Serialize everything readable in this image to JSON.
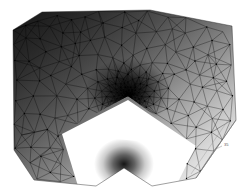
{
  "figure": {
    "kind": "finite-element-mesh",
    "background_color": "#ffffff",
    "ink_color": "#000000",
    "corner_label": "35",
    "canvas": {
      "width": 243,
      "height": 188
    }
  },
  "chart_data": {
    "type": "scatter",
    "subtitle": "Grayscale shaded solution field over a doubly notched polygonal domain",
    "xlabel": "",
    "ylabel": "",
    "xlim": [
      0,
      243
    ],
    "ylim": [
      0,
      188
    ],
    "grid": false,
    "legend_position": "none",
    "annotations": [
      "35"
    ],
    "domain_outline": [
      [
        13,
        30
      ],
      [
        42,
        12
      ],
      [
        150,
        10
      ],
      [
        232,
        26
      ],
      [
        236,
        120
      ],
      [
        196,
        178
      ],
      [
        34,
        180
      ],
      [
        14,
        150
      ]
    ],
    "notches": [
      {
        "name": "upper-notch",
        "tip": [
          128,
          96
        ],
        "opening_left": [
          60,
          132
        ],
        "opening_right": [
          190,
          140
        ],
        "refinement_levels": 9,
        "min_element_size_px": 0.4
      },
      {
        "name": "lower-notch",
        "tip": [
          124,
          168
        ],
        "opening_left": [
          96,
          186
        ],
        "opening_right": [
          152,
          186
        ],
        "refinement_levels": 8,
        "min_element_size_px": 0.4
      }
    ],
    "shading": {
      "colormap": "grayscale",
      "dark_value_corner": "upper-left",
      "light_value_corner": "lower-right",
      "dark_hex": "#1a1a1a",
      "light_hex": "#ffffff"
    },
    "series": [
      {
        "name": "mesh-edges",
        "kind": "triangulation-edges",
        "color": "#000000",
        "approx_count": 4200
      },
      {
        "name": "mesh-nodes",
        "kind": "vertices",
        "color": "#000000",
        "approx_count": 1400
      }
    ]
  }
}
